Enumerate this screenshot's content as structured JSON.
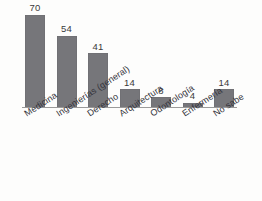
{
  "chart_data": {
    "type": "bar",
    "title": "",
    "subtitle": "",
    "xlabel": "",
    "ylabel": "",
    "categories": [
      "Medicina",
      "Ingenierías (general)",
      "Derecho",
      "Arquitectura",
      "Odontología",
      "Enfermería",
      "No sabe"
    ],
    "values": [
      70,
      54,
      41,
      14,
      8,
      4,
      14
    ],
    "value_labels": [
      "70",
      "54",
      "41",
      "14",
      "8",
      "4",
      "14"
    ],
    "ylim": [
      0,
      70
    ],
    "grid": false,
    "legend": false,
    "legend_position": "none",
    "yaxis_visible": false,
    "xaxis_visible": true,
    "bar_color": "#76767a",
    "label_color": "#33333a",
    "axis_color": "#9a9a9a",
    "background_color": "#fdfdfc",
    "label_rotation_deg": -33
  }
}
